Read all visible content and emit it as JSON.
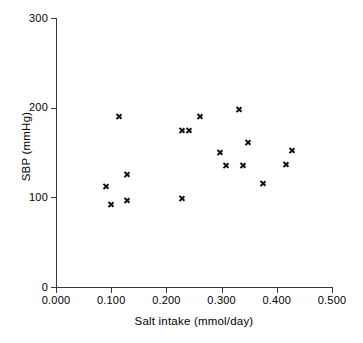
{
  "chart_data": {
    "type": "scatter",
    "title": "",
    "xlabel": "Salt intake (mmol/day)",
    "ylabel": "SBP (mmHg)",
    "xlim": [
      0.0,
      0.5
    ],
    "ylim": [
      0,
      300
    ],
    "xticks": [
      "0.000",
      "0.100",
      "0.200",
      "0.300",
      "0.400",
      "0.500"
    ],
    "xtick_values": [
      0.0,
      0.1,
      0.2,
      0.3,
      0.4,
      0.5
    ],
    "yticks": [
      "0",
      "100",
      "200",
      "300"
    ],
    "ytick_values": [
      0,
      100,
      200,
      300
    ],
    "grid": false,
    "legend": false,
    "marker": "x",
    "marker_color": "#111111",
    "axis_color": "#3a3a3a",
    "background": "#ffffff",
    "x": [
      0.09,
      0.1,
      0.113,
      0.128,
      0.129,
      0.228,
      0.227,
      0.24,
      0.261,
      0.297,
      0.308,
      0.332,
      0.338,
      0.348,
      0.375,
      0.417,
      0.428
    ],
    "y": [
      112,
      92,
      190,
      125,
      97,
      99,
      175,
      175,
      190,
      150,
      136,
      198,
      135,
      161,
      115,
      137,
      152
    ],
    "points": [
      {
        "x": 0.09,
        "y": 112
      },
      {
        "x": 0.1,
        "y": 92
      },
      {
        "x": 0.113,
        "y": 190
      },
      {
        "x": 0.128,
        "y": 125
      },
      {
        "x": 0.129,
        "y": 97
      },
      {
        "x": 0.228,
        "y": 99
      },
      {
        "x": 0.227,
        "y": 175
      },
      {
        "x": 0.24,
        "y": 175
      },
      {
        "x": 0.261,
        "y": 190
      },
      {
        "x": 0.297,
        "y": 150
      },
      {
        "x": 0.308,
        "y": 136
      },
      {
        "x": 0.332,
        "y": 198
      },
      {
        "x": 0.338,
        "y": 135
      },
      {
        "x": 0.348,
        "y": 161
      },
      {
        "x": 0.375,
        "y": 115
      },
      {
        "x": 0.417,
        "y": 137
      },
      {
        "x": 0.428,
        "y": 152
      }
    ]
  },
  "geometry": {
    "left": 56,
    "right": 332,
    "top": 18,
    "bottom": 287
  }
}
